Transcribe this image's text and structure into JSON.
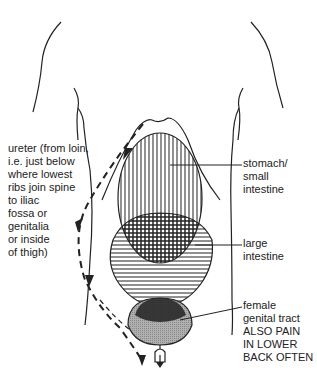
{
  "diagram": {
    "labels": {
      "ureter": [
        "ureter (from loin,",
        "i.e. just below",
        "where lowest",
        "ribs join spine",
        "to iliac",
        "fossa or",
        "genitalia",
        "or inside",
        "of thigh)"
      ],
      "stomach": [
        "stomach/",
        "small",
        "intestine"
      ],
      "large_intestine": [
        "large",
        "intestine"
      ],
      "female": [
        "female",
        "genital tract"
      ],
      "note": [
        "ALSO PAIN",
        "IN LOWER",
        "BACK OFTEN"
      ]
    },
    "colors": {
      "line": "#222222",
      "background": "#ffffff",
      "shade": "#9a9a9a"
    }
  }
}
